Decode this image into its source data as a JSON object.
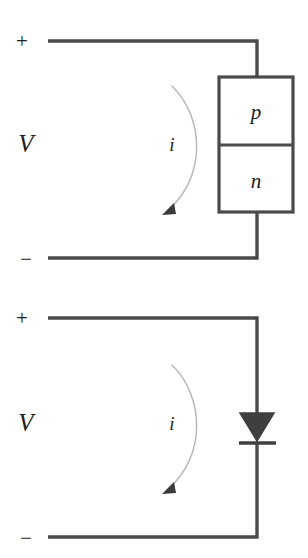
{
  "figure": {
    "background_color": "#ffffff",
    "line_color": "#4a4a4a",
    "arc_color": "#b9b9b9",
    "fill_color": "#3f3f3f",
    "text_color": "#1d1d1d"
  },
  "circuits": [
    {
      "id": "pn-junction-circuit",
      "name": "p-n junction block circuit",
      "labels": {
        "plus": "+",
        "minus": "−",
        "voltage": "V",
        "current": "i"
      },
      "device": {
        "type": "pn-junction-block",
        "top_region": "p",
        "bottom_region": "n"
      }
    },
    {
      "id": "diode-symbol-circuit",
      "name": "diode symbol circuit",
      "labels": {
        "plus": "+",
        "minus": "−",
        "voltage": "V",
        "current": "i"
      },
      "device": {
        "type": "diode-symbol",
        "anode_label": "",
        "cathode_label": ""
      }
    }
  ],
  "icons": {
    "arrow_head": "current-direction-arrowhead",
    "diode_triangle": "diode-anode-triangle",
    "diode_bar": "diode-cathode-bar"
  }
}
